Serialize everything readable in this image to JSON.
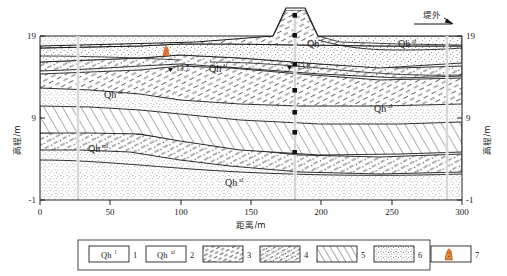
{
  "figure": {
    "kind": "geological-cross-section",
    "y_axis": {
      "label": "高程/m",
      "ticks": [
        19,
        9,
        -1
      ],
      "min": -6,
      "max": 19
    },
    "x_axis": {
      "label": "距离/m",
      "ticks": [
        0,
        50,
        100,
        150,
        200,
        250,
        300
      ],
      "min": 0,
      "max": 300
    },
    "direction_note": {
      "text": "堤外",
      "icon": "arrow-right-icon"
    }
  },
  "strata_labels": [
    {
      "base": "Qh",
      "sup": "al",
      "x": 110,
      "y": 98
    },
    {
      "base": "Qh",
      "sup": "al",
      "x": 215,
      "y": 72
    },
    {
      "base": "Qh",
      "sup": "l",
      "x": 313,
      "y": 47
    },
    {
      "base": "Qh",
      "sup": "al",
      "x": 410,
      "y": 47
    },
    {
      "base": "Qh",
      "sup": "al",
      "x": 385,
      "y": 112
    },
    {
      "base": "Qh",
      "sup": "ml",
      "x": 95,
      "y": 150
    },
    {
      "base": "Qh",
      "sup": "al",
      "x": 232,
      "y": 186
    }
  ],
  "boreholes": [
    {
      "name": "borehole-left",
      "x": 78,
      "water_level": "13.7"
    },
    {
      "name": "borehole-center",
      "x": 180,
      "water_level": "13.8"
    },
    {
      "name": "borehole-right",
      "x": 287,
      "water_level": ""
    }
  ],
  "rig_marker": {
    "name": "drill-rig-icon",
    "x": 163,
    "y": 50,
    "color": "#e0762c"
  },
  "legend": {
    "items": [
      {
        "num": "1",
        "pattern": "blank",
        "base": "Qh",
        "sup": "l"
      },
      {
        "num": "2",
        "pattern": "blank",
        "base": "Qh",
        "sup": "al"
      },
      {
        "num": "3",
        "pattern": "hatch-dash",
        "base": "",
        "sup": ""
      },
      {
        "num": "4",
        "pattern": "dash-dot-mix",
        "base": "",
        "sup": ""
      },
      {
        "num": "5",
        "pattern": "hatch-solid",
        "base": "",
        "sup": ""
      },
      {
        "num": "6",
        "pattern": "stipple",
        "base": "",
        "sup": ""
      },
      {
        "num": "7",
        "pattern": "rig-symbol",
        "base": "",
        "sup": ""
      }
    ]
  },
  "colors": {
    "ink": "#1a1a1a",
    "rig": "#e0762c",
    "stipple": "#6b6b6b",
    "frame": "#222222"
  }
}
